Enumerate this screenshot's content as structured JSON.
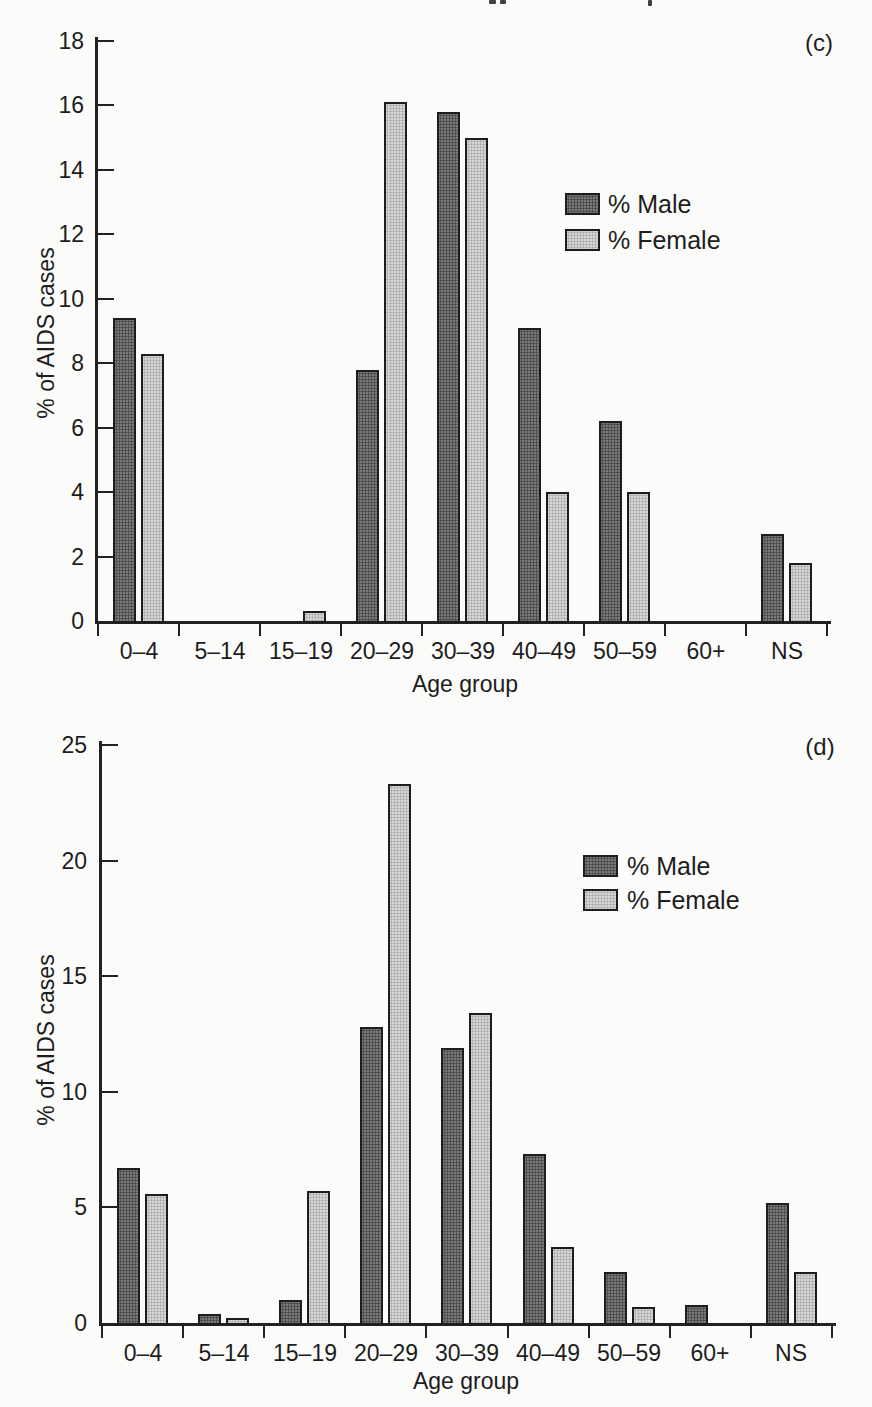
{
  "page": {
    "background": "#fbfbf9",
    "text_color": "#1d1d1d",
    "axis_color": "#222220"
  },
  "chart_data": [
    {
      "type": "bar",
      "panel_label": "(c)",
      "title": "",
      "xlabel": "Age group",
      "ylabel": "% of AIDS cases",
      "categories": [
        "0–4",
        "5–14",
        "15–19",
        "20–29",
        "30–39",
        "40–49",
        "50–59",
        "60+",
        "NS"
      ],
      "series": [
        {
          "name": "% Male",
          "color": "#7a7a78",
          "values": [
            9.4,
            0,
            0,
            7.8,
            15.8,
            9.1,
            6.2,
            0,
            2.7
          ]
        },
        {
          "name": "% Female",
          "color": "#d7d7d5",
          "values": [
            8.3,
            0,
            0.3,
            16.1,
            15.0,
            4.0,
            4.0,
            0,
            1.8
          ]
        }
      ],
      "yticks": [
        0,
        2,
        4,
        6,
        8,
        10,
        12,
        14,
        16,
        18
      ],
      "ylim": [
        0,
        18
      ],
      "grid": false,
      "legend_position": "inside-upper-right"
    },
    {
      "type": "bar",
      "panel_label": "(d)",
      "title": "",
      "xlabel": "Age group",
      "ylabel": "% of AIDS cases",
      "categories": [
        "0–4",
        "5–14",
        "15–19",
        "20–29",
        "30–39",
        "40–49",
        "50–59",
        "60+",
        "NS"
      ],
      "series": [
        {
          "name": "% Male",
          "color": "#7a7a78",
          "values": [
            6.7,
            0.4,
            1.0,
            12.8,
            11.9,
            7.3,
            2.2,
            0.8,
            5.2
          ]
        },
        {
          "name": "% Female",
          "color": "#d7d7d5",
          "values": [
            5.6,
            0.2,
            5.7,
            23.3,
            13.4,
            3.3,
            0.7,
            0,
            2.2
          ]
        }
      ],
      "yticks": [
        0,
        5,
        10,
        15,
        20,
        25
      ],
      "ylim": [
        0,
        25
      ],
      "grid": false,
      "legend_position": "inside-upper-right"
    }
  ]
}
